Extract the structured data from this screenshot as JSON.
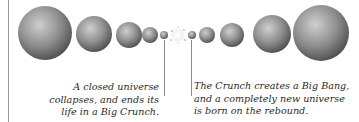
{
  "diagram": {
    "spheres": [
      {
        "id": "s1",
        "cx": 45,
        "cy": 33,
        "r": 27
      },
      {
        "id": "s2",
        "cx": 94,
        "cy": 34,
        "r": 18
      },
      {
        "id": "s3",
        "cx": 129,
        "cy": 35,
        "r": 13
      },
      {
        "id": "s4",
        "cx": 150,
        "cy": 35,
        "r": 8
      },
      {
        "id": "s5",
        "cx": 164,
        "cy": 35,
        "r": 4
      },
      {
        "id": "s6",
        "cx": 192,
        "cy": 35,
        "r": 4
      },
      {
        "id": "s7",
        "cx": 207,
        "cy": 35,
        "r": 8
      },
      {
        "id": "s8",
        "cx": 232,
        "cy": 35,
        "r": 12
      },
      {
        "id": "s9",
        "cx": 272,
        "cy": 34,
        "r": 19
      },
      {
        "id": "s10",
        "cx": 321,
        "cy": 33,
        "r": 28
      }
    ],
    "burst_center": {
      "cx": 178,
      "cy": 35
    },
    "colors": {
      "sphere_light": "#c8c8c8",
      "sphere_mid": "#8e8e8e",
      "sphere_dark": "#4a4a4a",
      "rule": "#9a9a9a",
      "text": "#2a2a2a"
    }
  },
  "captions": {
    "left": {
      "lines": [
        "A closed universe",
        "collapses, and ends its",
        "life in a Big Crunch."
      ]
    },
    "right": {
      "lines": [
        "The Crunch creates a Big Bang,",
        "and a completely new universe",
        "is born on the rebound."
      ]
    }
  }
}
